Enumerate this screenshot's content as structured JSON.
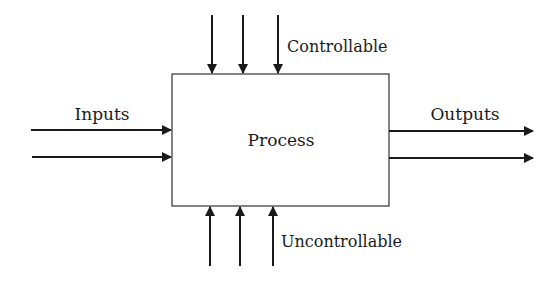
{
  "diagram": {
    "process_label": "Process",
    "inputs_label": "Inputs",
    "outputs_label": "Outputs",
    "controllable_label": "Controllable",
    "uncontrollable_label": "Uncontrollable",
    "colors": {
      "stroke": "#1a1a1a",
      "background": "#ffffff"
    }
  }
}
